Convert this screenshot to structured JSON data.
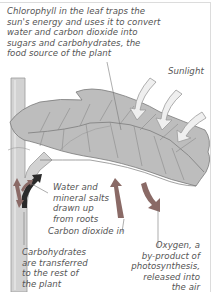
{
  "diagram": {
    "labels": {
      "chlorophyll": "Chlorophyll in the leaf traps the\nsun's energy and uses it to convert\nwater and carbon dioxide into\nsugars and carbohydrates, the\nfood source of the plant",
      "sunlight": "Sunlight",
      "water": "Water and\nmineral salts\ndrawn up\nfrom roots",
      "carbon_dioxide": "Carbon dioxide in",
      "carbohydrates": "Carbohydrates\nare transferred\nto the rest of\nthe plant",
      "oxygen": "Oxygen, a\nby-product of\nphotosynthesis,\nreleased into\nthe air"
    },
    "colors": {
      "text": "#555555",
      "leaf": "#bdbdbd",
      "leaf_vein": "#8a8a8a",
      "stem": "#cfcfcf",
      "arrow_gas": "#8a6a66",
      "arrow_water": "#2a2a2a",
      "arrow_sun": "#efefef",
      "frame": "#dcdcdc"
    },
    "icons": [
      "sunlight-arrow-icon",
      "carbon-dioxide-arrow-icon",
      "oxygen-arrow-icon",
      "water-arrow-icon",
      "carbohydrate-arrow-icon"
    ]
  }
}
